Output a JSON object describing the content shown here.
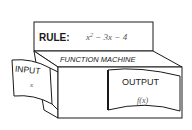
{
  "diagram": {
    "title": "FUNCTION MACHINE",
    "rule": {
      "label": "RULE:",
      "expression_base": "x",
      "expression_exp": "2",
      "expression_rest": " − 3x − 4"
    },
    "input": {
      "label": "INPUT",
      "value": "x"
    },
    "output": {
      "label": "OUTPUT",
      "value": "f(x)"
    }
  },
  "colors": {
    "stroke": "#1a1a1a",
    "background": "#ffffff",
    "math_text": "#555555"
  }
}
